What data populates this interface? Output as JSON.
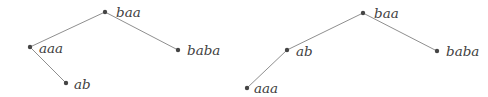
{
  "style": {
    "background": "#ffffff",
    "edge_color": "#8f8f8f",
    "edge_width": 1,
    "node_color": "#454545",
    "node_radius": 2.2,
    "label_color": "#3f3f3f",
    "label_dx": 9,
    "label_dy": 5.5
  },
  "diagrams": [
    {
      "name": "left-tree",
      "nodes": [
        {
          "id": "baa",
          "label": "baa",
          "x": 105,
          "y": 12,
          "label_dx": 11,
          "label_dy": 5
        },
        {
          "id": "aaa",
          "label": "aaa",
          "x": 30,
          "y": 47,
          "label_dx": 9,
          "label_dy": 6
        },
        {
          "id": "baba",
          "label": "baba",
          "x": 178,
          "y": 50,
          "label_dx": 9,
          "label_dy": 5
        },
        {
          "id": "ab",
          "label": "ab",
          "x": 66,
          "y": 83,
          "label_dx": 8,
          "label_dy": 6
        }
      ],
      "edges": [
        {
          "from": "baa",
          "to": "aaa"
        },
        {
          "from": "baa",
          "to": "baba"
        },
        {
          "from": "aaa",
          "to": "ab"
        }
      ]
    },
    {
      "name": "right-tree",
      "nodes": [
        {
          "id": "baa",
          "label": "baa",
          "x": 363,
          "y": 13,
          "label_dx": 11,
          "label_dy": 5
        },
        {
          "id": "ab",
          "label": "ab",
          "x": 287,
          "y": 50,
          "label_dx": 9,
          "label_dy": 6
        },
        {
          "id": "aaa",
          "label": "aaa",
          "x": 247,
          "y": 88,
          "label_dx": 7,
          "label_dy": 5
        },
        {
          "id": "baba",
          "label": "baba",
          "x": 437,
          "y": 51,
          "label_dx": 9,
          "label_dy": 5
        }
      ],
      "edges": [
        {
          "from": "baa",
          "to": "ab"
        },
        {
          "from": "ab",
          "to": "aaa"
        },
        {
          "from": "baa",
          "to": "baba"
        }
      ]
    }
  ]
}
